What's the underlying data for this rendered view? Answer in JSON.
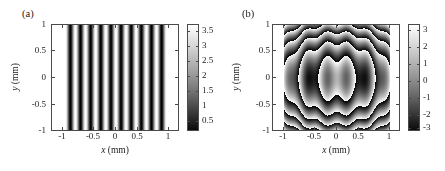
{
  "figure": {
    "panels": [
      {
        "id": "a",
        "label": "(a)",
        "xlabel_var": "x",
        "xlabel_unit": "(mm)",
        "ylabel_var": "y",
        "ylabel_unit": "(mm)",
        "xticks": [
          "-1",
          "-0.5",
          "0",
          "0.5",
          "1"
        ],
        "yticks": [
          "1",
          "0.5",
          "0",
          "-0.5",
          "-1"
        ],
        "cticks": [
          "3.5",
          "3",
          "2.5",
          "2",
          "1.5",
          "1",
          "0.5"
        ]
      },
      {
        "id": "b",
        "label": "(b)",
        "xlabel_var": "x",
        "xlabel_unit": "(mm)",
        "ylabel_var": "y",
        "ylabel_unit": "(mm)",
        "xticks": [
          "-1",
          "-0.5",
          "0",
          "0.5",
          "1"
        ],
        "yticks": [
          "1",
          "0.5",
          "0",
          "-0.5",
          "-1"
        ],
        "cticks": [
          "3",
          "2",
          "1",
          "0",
          "-1",
          "-2",
          "-3"
        ]
      }
    ]
  },
  "chart_data": [
    {
      "type": "heatmap",
      "panel": "a",
      "title": "(a)",
      "xlabel": "x (mm)",
      "ylabel": "y (mm)",
      "xlim": [
        -1.2,
        1.2
      ],
      "ylim": [
        -1,
        1
      ],
      "xticks": [
        -1,
        -0.5,
        0,
        0.5,
        1
      ],
      "yticks": [
        -1,
        -0.5,
        0,
        0.5,
        1
      ],
      "colormap": "gray",
      "clim": [
        0.2,
        3.6
      ],
      "cticks": [
        0.5,
        1,
        1.5,
        2,
        2.5,
        3,
        3.5
      ],
      "cbar_label": "",
      "grid": false,
      "description": "Vertical sinusoidal interference fringes, intensity independent of y, confined to |x| < 0.95 mm; uniform white (saturated high value) outside that aperture.",
      "pattern": "cosine-fringes-vertical",
      "fringe_period_mm": 0.19,
      "fringe_count": 11,
      "aperture_x_mm": [
        -0.95,
        0.95
      ],
      "x_samples": [
        -1.2,
        -1.1,
        -1.0,
        -0.95,
        -0.9,
        -0.85,
        -0.8,
        -0.75,
        -0.7,
        -0.65,
        -0.6,
        -0.55,
        -0.5,
        -0.45,
        -0.4,
        -0.35,
        -0.3,
        -0.25,
        -0.2,
        -0.15,
        -0.1,
        -0.05,
        0.0,
        0.05,
        0.1,
        0.15,
        0.2,
        0.25,
        0.3,
        0.35,
        0.4,
        0.45,
        0.5,
        0.55,
        0.6,
        0.65,
        0.7,
        0.75,
        0.8,
        0.85,
        0.9,
        0.95,
        1.0,
        1.1,
        1.2
      ],
      "intensity_samples": [
        3.6,
        3.6,
        3.6,
        3.6,
        0.3,
        2.0,
        3.5,
        2.1,
        0.3,
        1.3,
        3.2,
        3.1,
        1.0,
        0.3,
        2.5,
        3.6,
        1.7,
        0.3,
        1.8,
        3.6,
        2.4,
        0.3,
        1.1,
        3.2,
        3.2,
        1.0,
        0.3,
        1.8,
        3.6,
        2.4,
        0.3,
        1.2,
        3.3,
        3.0,
        0.8,
        0.3,
        2.6,
        3.6,
        1.6,
        0.3,
        2.0,
        3.5,
        3.6,
        3.6,
        3.6
      ]
    },
    {
      "type": "heatmap",
      "panel": "b",
      "title": "(b)",
      "xlabel": "x (mm)",
      "ylabel": "y (mm)",
      "xlim": [
        -1.2,
        1.2
      ],
      "ylim": [
        -1,
        1
      ],
      "xticks": [
        -1,
        -0.5,
        0,
        0.5,
        1
      ],
      "yticks": [
        -1,
        -0.5,
        0,
        0.5,
        1
      ],
      "colormap": "gray",
      "clim": [
        -3.3,
        3.3
      ],
      "cticks": [
        -3,
        -2,
        -1,
        0,
        1,
        2,
        3
      ],
      "cbar_label": "",
      "grid": false,
      "description": "Wrapped phase map in radians: concentric elliptical rings (quadratic radial phase) modulated by vertical linear-carrier fringes; saturated white outside |x| > 1.0 mm aperture.",
      "pattern": "wrapped-phase-concentric-rings",
      "ring_count": 5,
      "radial_quadratic": true,
      "carrier_period_mm": 0.38,
      "aperture_x_mm": [
        -1.0,
        1.0
      ],
      "center": [
        0.0,
        0.0
      ],
      "value_range_rad": [
        -3.1416,
        3.1416
      ]
    }
  ]
}
